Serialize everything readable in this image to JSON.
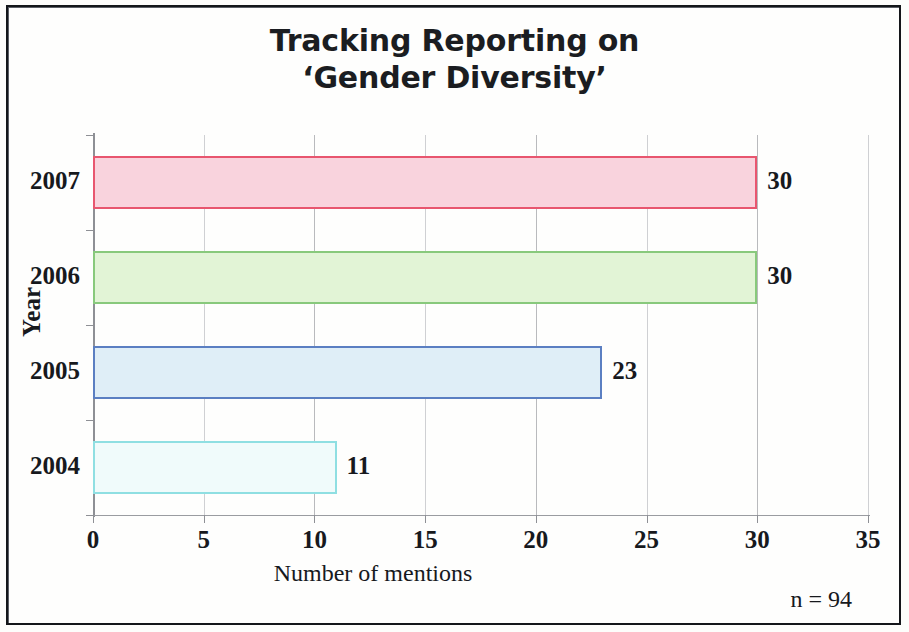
{
  "chart_data": {
    "type": "bar",
    "orientation": "horizontal",
    "title_line1": "Tracking Reporting on",
    "title_line2": "‘Gender Diversity’",
    "categories": [
      "2007",
      "2006",
      "2005",
      "2004"
    ],
    "values": [
      30,
      30,
      23,
      11
    ],
    "value_labels": [
      "30",
      "30",
      "23",
      "11"
    ],
    "xlabel": "Number of mentions",
    "ylabel": "Year",
    "xlim": [
      0,
      35
    ],
    "xticks": [
      "0",
      "5",
      "10",
      "15",
      "20",
      "25",
      "30",
      "35"
    ],
    "xtick_values": [
      0,
      5,
      10,
      15,
      20,
      25,
      30,
      35
    ],
    "grid": true,
    "legend": false,
    "annotation": "n = 94",
    "bar_styles": [
      {
        "category": "2007",
        "fill": "#f9d3dd",
        "border": "#e8566f"
      },
      {
        "category": "2006",
        "fill": "#e2f4d6",
        "border": "#88c97c"
      },
      {
        "category": "2005",
        "fill": "#dfeef7",
        "border": "#5b7fc2"
      },
      {
        "category": "2004",
        "fill": "#f0fbfb",
        "border": "#8fdfe2"
      }
    ]
  },
  "colors": {
    "frame": "#14161a",
    "text": "#17191d",
    "gridline": "#b9babd",
    "axis": "#8e9095"
  }
}
